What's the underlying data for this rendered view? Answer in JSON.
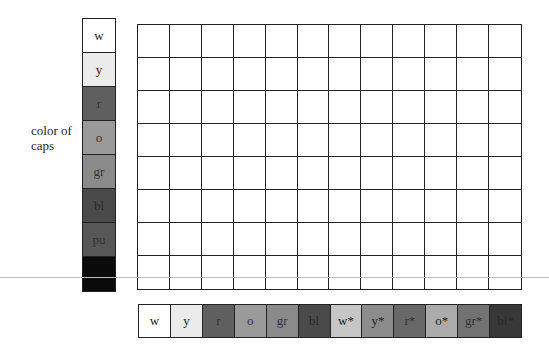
{
  "row_axis_label": [
    "color of",
    "caps"
  ],
  "row_colors": [
    {
      "label": "w",
      "fill": "#ffffff",
      "text": "#222222"
    },
    {
      "label": "y",
      "fill": "#ebebeb",
      "text": "#222222"
    },
    {
      "label": "r",
      "fill": "#5f5f5f",
      "text": "#333333"
    },
    {
      "label": "o",
      "fill": "#9a9a9a",
      "text": "#333333"
    },
    {
      "label": "gr",
      "fill": "#8a8a8a",
      "text": "#333333"
    },
    {
      "label": "bl",
      "fill": "#4a4a4a",
      "text": "#2a2a2a"
    },
    {
      "label": "pu",
      "fill": "#575757",
      "text": "#333333"
    },
    {
      "label": "",
      "fill": "#0a0a0a",
      "text": "#000000"
    }
  ],
  "column_colors": [
    {
      "label": "w",
      "fill": "#ffffff",
      "text": "#222222"
    },
    {
      "label": "y",
      "fill": "#ebebeb",
      "text": "#222222"
    },
    {
      "label": "r",
      "fill": "#5f5f5f",
      "text": "#333333"
    },
    {
      "label": "o",
      "fill": "#9a9a9a",
      "text": "#333333"
    },
    {
      "label": "gr",
      "fill": "#8a8a8a",
      "text": "#333333"
    },
    {
      "label": "bl",
      "fill": "#4a4a4a",
      "text": "#2a2a2a"
    },
    {
      "label": "w*",
      "fill": "#c6c6c6",
      "text": "#222222"
    },
    {
      "label": "y*",
      "fill": "#8c8c8c",
      "text": "#222222"
    },
    {
      "label": "r*",
      "fill": "#686868",
      "text": "#333333"
    },
    {
      "label": "o*",
      "fill": "#ababab",
      "text": "#222222"
    },
    {
      "label": "gr*",
      "fill": "#727272",
      "text": "#333333"
    },
    {
      "label": "bl*",
      "fill": "#383838",
      "text": "#2a2a2a"
    }
  ],
  "grid": {
    "rows": 8,
    "cols": 12
  }
}
